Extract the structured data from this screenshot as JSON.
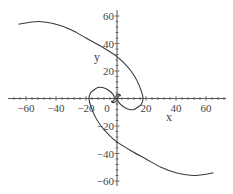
{
  "chart_data": {
    "type": "line",
    "title": "",
    "xlabel": "x",
    "ylabel": "y",
    "xlim": [
      -72,
      73
    ],
    "ylim": [
      -62,
      62
    ],
    "grid": false,
    "legend": null,
    "x_ticks": [
      -60,
      -40,
      -20,
      0,
      20,
      40,
      60
    ],
    "y_ticks": [
      -60,
      -40,
      -20,
      20,
      40,
      60
    ],
    "x_tick_labels": [
      "-60",
      "-40",
      "-20",
      "0",
      "20",
      "40",
      "60"
    ],
    "y_tick_labels": [
      "-60",
      "-40",
      "-20",
      "20",
      "40",
      "60"
    ],
    "series": [
      {
        "name": "arm-1",
        "points": [
          [
            -65,
            54
          ],
          [
            -52,
            56
          ],
          [
            -40,
            54
          ],
          [
            -30,
            50
          ],
          [
            -20,
            44
          ],
          [
            -10,
            38
          ],
          [
            0,
            31
          ],
          [
            6,
            25
          ],
          [
            10,
            20
          ],
          [
            14,
            13
          ],
          [
            17,
            5
          ],
          [
            18,
            0
          ],
          [
            17,
            -4
          ],
          [
            15,
            -6
          ],
          [
            12,
            -8
          ],
          [
            9,
            -8
          ],
          [
            5,
            -6
          ],
          [
            2,
            -3
          ],
          [
            1,
            0
          ],
          [
            2,
            2
          ],
          [
            3,
            2
          ],
          [
            2,
            3
          ],
          [
            0,
            2
          ],
          [
            0,
            0
          ]
        ]
      },
      {
        "name": "arm-2",
        "points": [
          [
            65,
            -54
          ],
          [
            52,
            -56
          ],
          [
            40,
            -54
          ],
          [
            30,
            -50
          ],
          [
            20,
            -44
          ],
          [
            10,
            -38
          ],
          [
            0,
            -31
          ],
          [
            -6,
            -25
          ],
          [
            -10,
            -20
          ],
          [
            -14,
            -13
          ],
          [
            -17,
            -5
          ],
          [
            -18,
            0
          ],
          [
            -17,
            4
          ],
          [
            -15,
            6
          ],
          [
            -12,
            8
          ],
          [
            -9,
            8
          ],
          [
            -5,
            6
          ],
          [
            -2,
            3
          ],
          [
            -1,
            0
          ],
          [
            -2,
            -2
          ],
          [
            -3,
            -2
          ],
          [
            -2,
            -3
          ],
          [
            0,
            -2
          ],
          [
            0,
            0
          ]
        ]
      }
    ],
    "colors": {
      "curve": "#3a3a3a",
      "axis": "#555555"
    }
  }
}
